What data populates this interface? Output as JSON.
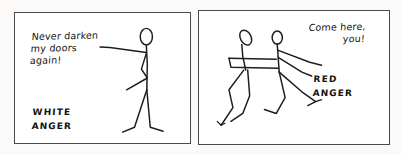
{
  "comic": {
    "title": "White Anger / Red Anger",
    "background_color": "#fbfaf8",
    "ink_color": "#1d1d1d",
    "panel_border_color": "#4a4a4a",
    "panels": [
      {
        "id": "white-anger",
        "speech": "Never darken\nmy doors\nagain!",
        "label": "WHITE\nANGER",
        "figures": "one upright stick figure pointing an outstretched arm to the left"
      },
      {
        "id": "red-anger",
        "speech": "Come here,\nyou!",
        "label": "RED\nANGER",
        "figures": "two stick figures lunging, one grabbing the other"
      }
    ]
  }
}
